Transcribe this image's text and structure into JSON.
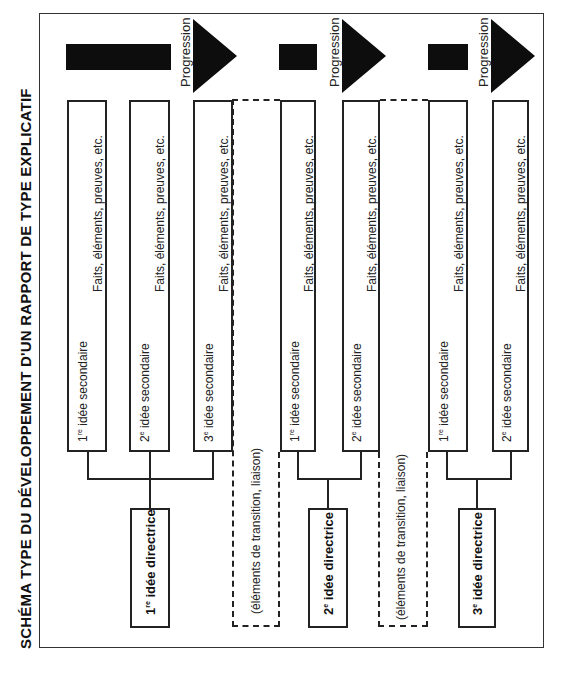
{
  "title": "SCHÉMA TYPE DU DÉVELOPPEMENT D'UN RAPPORT DE TYPE EXPLICATIF",
  "progression_label": "Progression",
  "facts_label": "Faits, éléments, preuves, etc.",
  "transition_label": "(éléments de transition, liaison)",
  "groups": [
    {
      "directrice": {
        "num": "1",
        "sup": "re",
        "label": "idée directrice"
      },
      "secondaires": [
        {
          "num": "1",
          "sup": "re",
          "label": "idée secondaire"
        },
        {
          "num": "2",
          "sup": "e",
          "label": "idée secondaire"
        },
        {
          "num": "3",
          "sup": "e",
          "label": "idée secondaire"
        }
      ]
    },
    {
      "directrice": {
        "num": "2",
        "sup": "e",
        "label": "idée directrice"
      },
      "secondaires": [
        {
          "num": "1",
          "sup": "re",
          "label": "idée secondaire"
        },
        {
          "num": "2",
          "sup": "e",
          "label": "idée secondaire"
        }
      ]
    },
    {
      "directrice": {
        "num": "3",
        "sup": "e",
        "label": "idée directrice"
      },
      "secondaires": [
        {
          "num": "1",
          "sup": "re",
          "label": "idée secondaire"
        },
        {
          "num": "2",
          "sup": "e",
          "label": "idée secondaire"
        }
      ]
    }
  ],
  "colors": {
    "ink": "#0d0d0d",
    "line": "#222222",
    "background": "#ffffff"
  }
}
